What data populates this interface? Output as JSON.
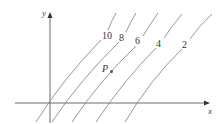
{
  "figure": {
    "axes": {
      "x_label": "x",
      "y_label": "y"
    },
    "level_curves": [
      {
        "label": "10"
      },
      {
        "label": "8"
      },
      {
        "label": "6"
      },
      {
        "label": "4"
      },
      {
        "label": "2"
      }
    ],
    "point": {
      "label": "P"
    }
  }
}
